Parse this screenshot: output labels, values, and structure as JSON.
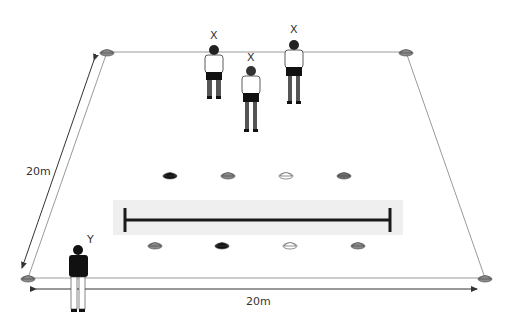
{
  "field": {
    "width_label": "20m",
    "depth_label": "20m",
    "line_color": "#9a9a9a",
    "arrow_color": "#333333"
  },
  "players": {
    "x_group_label": "X",
    "x_labels": [
      "X",
      "X",
      "X"
    ],
    "y_label": "Y"
  },
  "cones": {
    "corners": [
      "#8a8a8a",
      "#8a8a8a",
      "#8a8a8a",
      "#8a8a8a"
    ],
    "top_row": [
      "#111111",
      "#8a8a8a",
      "#ffffff",
      "#6e6e6e"
    ],
    "bottom_row": [
      "#8a8a8a",
      "#111111",
      "#ffffff",
      "#8a8a8a"
    ]
  },
  "center_line": {
    "color": "#1a1a1a",
    "band_color": "#efefef"
  }
}
